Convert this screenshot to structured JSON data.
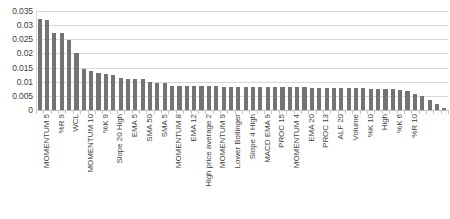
{
  "chart_data": {
    "type": "bar",
    "title": "",
    "xlabel": "",
    "ylabel": "",
    "ylim": [
      0,
      0.035
    ],
    "y_ticks": [
      "0",
      "0.005",
      "0.01",
      "0.015",
      "0.02",
      "0.025",
      "0.03",
      "0.035"
    ],
    "y_tick_values": [
      0,
      0.005,
      0.01,
      0.015,
      0.02,
      0.025,
      0.03,
      0.035
    ],
    "grid": true,
    "legend": "none",
    "bar_color": "#737373",
    "gridline_color": "#d9d9d9",
    "categories": [
      "MOMENTUM 5",
      "",
      "%R 9",
      "",
      "WCL",
      "",
      "MOMENTUM 10",
      "",
      "%K 9",
      "",
      "Slope 20 High",
      "",
      "EMA 5",
      "",
      "SMA 50",
      "",
      "SMA 5",
      "",
      "MOMENTUM 8",
      "",
      "EMA 12",
      "",
      "High price average 2",
      "",
      "MOMENTUM 9",
      "",
      "Lower Bollinger",
      "",
      "Slope 4 High",
      "",
      "MACD EMA 9",
      "",
      "PROC 15",
      "",
      "MOMENTUM 4",
      "",
      "EMA 20",
      "",
      "PROC 13",
      "",
      "ALF 20",
      "",
      "Volume",
      "",
      "%K 10",
      "",
      "High",
      "",
      "%K 6",
      "",
      "%R 10",
      "",
      "",
      "",
      "",
      ""
    ],
    "visible_labels": [
      "MOMENTUM 5",
      "%R 9",
      "WCL",
      "MOMENTUM 10",
      "%K 9",
      "Slope 20 High",
      "EMA 5",
      "SMA 50",
      "SMA 5",
      "MOMENTUM 8",
      "EMA 12",
      "High price average 2",
      "MOMENTUM 9",
      "Lower Bollinger",
      "Slope 4 High",
      "MACD EMA 9",
      "PROC 15",
      "MOMENTUM 4",
      "EMA 20",
      "PROC 13",
      "ALF 20",
      "Volume",
      "%K 10",
      "High",
      "%K 6",
      "%R 10"
    ],
    "values": [
      0.0322,
      0.0318,
      0.0272,
      0.0272,
      0.0248,
      0.0202,
      0.0144,
      0.0138,
      0.013,
      0.0128,
      0.0124,
      0.0113,
      0.011,
      0.0109,
      0.0108,
      0.0098,
      0.0097,
      0.0096,
      0.0086,
      0.0085,
      0.0085,
      0.0084,
      0.0084,
      0.0084,
      0.0084,
      0.0083,
      0.0083,
      0.0083,
      0.0082,
      0.0082,
      0.0082,
      0.0081,
      0.0081,
      0.0081,
      0.008,
      0.008,
      0.008,
      0.0079,
      0.0079,
      0.0079,
      0.0078,
      0.0078,
      0.0078,
      0.0077,
      0.0077,
      0.0076,
      0.0076,
      0.0075,
      0.0074,
      0.0072,
      0.0068,
      0.0058,
      0.0048,
      0.0034,
      0.0022,
      0.0008
    ]
  }
}
